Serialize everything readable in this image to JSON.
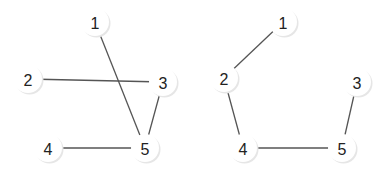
{
  "graphs": [
    {
      "name": "left-graph",
      "nodes": [
        {
          "id": "1",
          "label": "1",
          "x": 95,
          "y": 22
        },
        {
          "id": "2",
          "label": "2",
          "x": 28,
          "y": 79
        },
        {
          "id": "3",
          "label": "3",
          "x": 163,
          "y": 82
        },
        {
          "id": "4",
          "label": "4",
          "x": 48,
          "y": 148
        },
        {
          "id": "5",
          "label": "5",
          "x": 145,
          "y": 148
        }
      ],
      "edges": [
        {
          "from": "1",
          "to": "5"
        },
        {
          "from": "2",
          "to": "3"
        },
        {
          "from": "3",
          "to": "5"
        },
        {
          "from": "4",
          "to": "5"
        }
      ]
    },
    {
      "name": "right-graph",
      "nodes": [
        {
          "id": "1",
          "label": "1",
          "x": 283,
          "y": 22
        },
        {
          "id": "2",
          "label": "2",
          "x": 224,
          "y": 78
        },
        {
          "id": "3",
          "label": "3",
          "x": 357,
          "y": 82
        },
        {
          "id": "4",
          "label": "4",
          "x": 243,
          "y": 148
        },
        {
          "id": "5",
          "label": "5",
          "x": 342,
          "y": 148
        }
      ],
      "edges": [
        {
          "from": "1",
          "to": "2"
        },
        {
          "from": "2",
          "to": "4"
        },
        {
          "from": "4",
          "to": "5"
        },
        {
          "from": "3",
          "to": "5"
        }
      ]
    }
  ],
  "style": {
    "node_radius": 14,
    "edge_color": "#555555",
    "node_fill": "#ffffff",
    "label_color": "#222222"
  }
}
